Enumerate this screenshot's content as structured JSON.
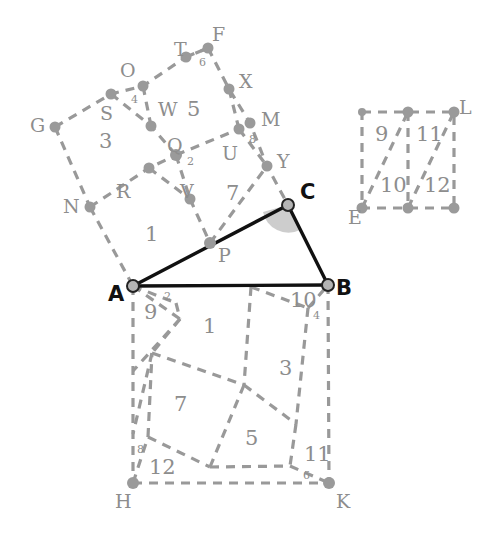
{
  "figure": {
    "canvas": {
      "width": 494,
      "height": 538
    },
    "colors": {
      "dashed_stroke": "#999999",
      "solid_stroke": "#111111",
      "node_fill": "#9a9a9a",
      "wedge_fill": "#bcbcbc",
      "label_gray": "#8d8d8d",
      "label_black": "#111111",
      "background": "#ffffff"
    },
    "vertex_labels": [
      {
        "id": "G",
        "text": "G",
        "x": 30,
        "y": 116,
        "style": "gray"
      },
      {
        "id": "S",
        "text": "S",
        "x": 100,
        "y": 104,
        "style": "gray"
      },
      {
        "id": "O",
        "text": "O",
        "x": 120,
        "y": 61,
        "style": "gray"
      },
      {
        "id": "T",
        "text": "T",
        "x": 174,
        "y": 40,
        "style": "gray"
      },
      {
        "id": "F",
        "text": "F",
        "x": 212,
        "y": 25,
        "style": "gray"
      },
      {
        "id": "X",
        "text": "X",
        "x": 239,
        "y": 72,
        "style": "gray"
      },
      {
        "id": "W",
        "text": "W",
        "x": 158,
        "y": 100,
        "style": "gray"
      },
      {
        "id": "M",
        "text": "M",
        "x": 261,
        "y": 110,
        "style": "gray"
      },
      {
        "id": "Q",
        "text": "Q",
        "x": 167,
        "y": 136,
        "style": "gray"
      },
      {
        "id": "U",
        "text": "U",
        "x": 222,
        "y": 144,
        "style": "gray"
      },
      {
        "id": "Y",
        "text": "Y",
        "x": 277,
        "y": 152,
        "style": "gray"
      },
      {
        "id": "N",
        "text": "N",
        "x": 63,
        "y": 197,
        "style": "gray"
      },
      {
        "id": "R",
        "text": "R",
        "x": 116,
        "y": 182,
        "style": "gray"
      },
      {
        "id": "V",
        "text": "V",
        "x": 180,
        "y": 182,
        "style": "gray"
      },
      {
        "id": "P",
        "text": "P",
        "x": 218,
        "y": 246,
        "style": "gray"
      },
      {
        "id": "C",
        "text": "C",
        "x": 300,
        "y": 182,
        "style": "black"
      },
      {
        "id": "A",
        "text": "A",
        "x": 108,
        "y": 284,
        "style": "black"
      },
      {
        "id": "B",
        "text": "B",
        "x": 336,
        "y": 278,
        "style": "black"
      },
      {
        "id": "H",
        "text": "H",
        "x": 115,
        "y": 492,
        "style": "gray"
      },
      {
        "id": "K",
        "text": "K",
        "x": 336,
        "y": 492,
        "style": "gray"
      },
      {
        "id": "E",
        "text": "E",
        "x": 348,
        "y": 208,
        "style": "gray"
      },
      {
        "id": "L",
        "text": "L",
        "x": 459,
        "y": 98,
        "style": "gray"
      }
    ],
    "piece_labels": [
      {
        "id": "p3-upper",
        "text": "3",
        "x": 99,
        "y": 131,
        "size": "large"
      },
      {
        "id": "p5-upper",
        "text": "5",
        "x": 187,
        "y": 99,
        "size": "large"
      },
      {
        "id": "p1-upper",
        "text": "1",
        "x": 145,
        "y": 224,
        "size": "large"
      },
      {
        "id": "p7-upper",
        "text": "7",
        "x": 226,
        "y": 183,
        "size": "large"
      },
      {
        "id": "p4-upper",
        "text": "4",
        "x": 131,
        "y": 94,
        "size": "small"
      },
      {
        "id": "p6-upper",
        "text": "6",
        "x": 199,
        "y": 57,
        "size": "small"
      },
      {
        "id": "p2-upper",
        "text": "2",
        "x": 187,
        "y": 156,
        "size": "small"
      },
      {
        "id": "p8-upper",
        "text": "8",
        "x": 249,
        "y": 134,
        "size": "small"
      },
      {
        "id": "p1-lower",
        "text": "1",
        "x": 203,
        "y": 316,
        "size": "large"
      },
      {
        "id": "p3-lower",
        "text": "3",
        "x": 279,
        "y": 358,
        "size": "large"
      },
      {
        "id": "p7-lower",
        "text": "7",
        "x": 174,
        "y": 394,
        "size": "large"
      },
      {
        "id": "p5-lower",
        "text": "5",
        "x": 245,
        "y": 428,
        "size": "large"
      },
      {
        "id": "p9-lower",
        "text": "9",
        "x": 144,
        "y": 302,
        "size": "large"
      },
      {
        "id": "p10-lower",
        "text": "10",
        "x": 290,
        "y": 290,
        "size": "large"
      },
      {
        "id": "p12-lower",
        "text": "12",
        "x": 149,
        "y": 457,
        "size": "large"
      },
      {
        "id": "p11-lower",
        "text": "11",
        "x": 304,
        "y": 444,
        "size": "large"
      },
      {
        "id": "p2-lower",
        "text": "2",
        "x": 164,
        "y": 291,
        "size": "small"
      },
      {
        "id": "p4-lower",
        "text": "4",
        "x": 313,
        "y": 310,
        "size": "small"
      },
      {
        "id": "p8-lower",
        "text": "8",
        "x": 137,
        "y": 444,
        "size": "small"
      },
      {
        "id": "p6-lower",
        "text": "6",
        "x": 303,
        "y": 470,
        "size": "small"
      },
      {
        "id": "p9-right",
        "text": "9",
        "x": 375,
        "y": 124,
        "size": "large"
      },
      {
        "id": "p11-right",
        "text": "11",
        "x": 416,
        "y": 124,
        "size": "large"
      },
      {
        "id": "p10-right",
        "text": "10",
        "x": 380,
        "y": 175,
        "size": "large"
      },
      {
        "id": "p12-right",
        "text": "12",
        "x": 424,
        "y": 175,
        "size": "large"
      }
    ],
    "nodes": [
      {
        "id": "G",
        "x": 55,
        "y": 127,
        "kind": "dot"
      },
      {
        "id": "S",
        "x": 111,
        "y": 94,
        "kind": "dot"
      },
      {
        "id": "O",
        "x": 143,
        "y": 86,
        "kind": "dot"
      },
      {
        "id": "T",
        "x": 186,
        "y": 57,
        "kind": "dot"
      },
      {
        "id": "F",
        "x": 208,
        "y": 48,
        "kind": "dot"
      },
      {
        "id": "X",
        "x": 229,
        "y": 89,
        "kind": "dot"
      },
      {
        "id": "W",
        "x": 151,
        "y": 126,
        "kind": "dot"
      },
      {
        "id": "M",
        "x": 250,
        "y": 123,
        "kind": "dot"
      },
      {
        "id": "Q",
        "x": 176,
        "y": 155,
        "kind": "dot"
      },
      {
        "id": "U",
        "x": 239,
        "y": 129,
        "kind": "dot"
      },
      {
        "id": "Y",
        "x": 267,
        "y": 166,
        "kind": "dot"
      },
      {
        "id": "N",
        "x": 90,
        "y": 207,
        "kind": "dot"
      },
      {
        "id": "R",
        "x": 149,
        "y": 168,
        "kind": "dot"
      },
      {
        "id": "V",
        "x": 190,
        "y": 199,
        "kind": "dot"
      },
      {
        "id": "P",
        "x": 210,
        "y": 243,
        "kind": "dot"
      },
      {
        "id": "C",
        "x": 288,
        "y": 205,
        "kind": "ring"
      },
      {
        "id": "A",
        "x": 133,
        "y": 286,
        "kind": "ring"
      },
      {
        "id": "B",
        "x": 328,
        "y": 285,
        "kind": "ring"
      },
      {
        "id": "H",
        "x": 133,
        "y": 483,
        "kind": "dot"
      },
      {
        "id": "K",
        "x": 329,
        "y": 483,
        "kind": "dot"
      },
      {
        "id": "E",
        "x": 362,
        "y": 208,
        "kind": "dot"
      },
      {
        "id": "L",
        "x": 454,
        "y": 112,
        "kind": "dot"
      },
      {
        "id": "RTmid",
        "x": 408,
        "y": 112,
        "kind": "dot"
      },
      {
        "id": "RBmid",
        "x": 408,
        "y": 208,
        "kind": "dot"
      },
      {
        "id": "RTL",
        "x": 362,
        "y": 112,
        "kind": "dot"
      },
      {
        "id": "RBR",
        "x": 454,
        "y": 208,
        "kind": "dot"
      },
      {
        "id": "ABmid",
        "x": 231,
        "y": 286,
        "kind": "dot"
      },
      {
        "id": "HKmid",
        "x": 231,
        "y": 483,
        "kind": "dot"
      }
    ],
    "solid_segments": [
      {
        "id": "AC",
        "from": "A",
        "to": "C"
      },
      {
        "id": "CB",
        "from": "C",
        "to": "B"
      },
      {
        "id": "AB",
        "from": "A",
        "to": "B"
      }
    ],
    "angle_marker": {
      "at": "C",
      "fill": "#bcbcbc",
      "radius": 26
    }
  }
}
